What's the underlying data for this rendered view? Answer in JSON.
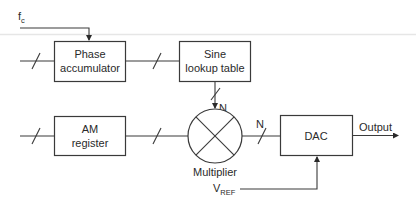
{
  "diagram": {
    "type": "block-diagram",
    "title": "",
    "inputs": {
      "fc": {
        "main": "f",
        "sub": "c"
      },
      "vref": {
        "main": "V",
        "sub": "REF"
      }
    },
    "blocks": {
      "phase_accumulator": {
        "line1": "Phase",
        "line2": "accumulator"
      },
      "sine_lookup": {
        "line1": "Sine",
        "line2": "lookup table"
      },
      "am_register": {
        "line1": "AM",
        "line2": "register"
      },
      "multiplier": {
        "label": "Multiplier"
      },
      "dac": {
        "label": "DAC"
      }
    },
    "bus_labels": {
      "sine_to_multiplier": "N",
      "multiplier_to_dac": "N"
    },
    "output_label": "Output",
    "colors": {
      "line": "#3a3a3a",
      "text": "#2a2a2a",
      "background": "#ffffff",
      "scan_line": "#e6e6e6"
    }
  }
}
